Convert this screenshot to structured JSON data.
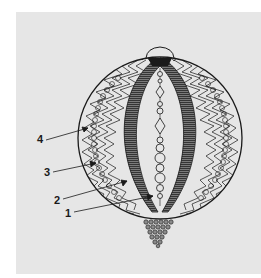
{
  "figure": {
    "panel_color": "#e6e6e6",
    "ink_color": "#1a1a1a",
    "band_color": "#5a5a5a",
    "labels": [
      {
        "id": "4",
        "text": "4",
        "x": 37,
        "y": 134,
        "line_from": [
          46,
          140
        ],
        "arrow_to": [
          88,
          128
        ]
      },
      {
        "id": "3",
        "text": "3",
        "x": 44,
        "y": 168,
        "line_from": [
          53,
          172
        ],
        "arrow_to": [
          96,
          163
        ]
      },
      {
        "id": "2",
        "text": "2",
        "x": 54,
        "y": 196,
        "line_from": [
          63,
          199
        ],
        "arrow_to": [
          127,
          181
        ]
      },
      {
        "id": "1",
        "text": "1",
        "x": 65,
        "y": 209,
        "line_from": [
          74,
          212
        ],
        "arrow_to": [
          153,
          196
        ]
      }
    ]
  }
}
